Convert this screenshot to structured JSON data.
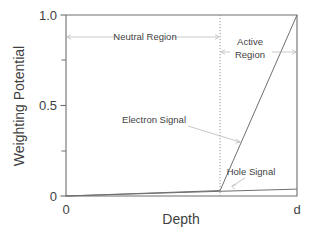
{
  "chart_data": {
    "type": "line",
    "title": "",
    "xlabel": "Depth",
    "ylabel": "Weighting Potential",
    "xlim": [
      0,
      1
    ],
    "ylim": [
      0,
      1
    ],
    "grid": false,
    "legend": "none",
    "x_tick_labels": [
      "0",
      "d"
    ],
    "x_tick_values": [
      0,
      1
    ],
    "y_tick_labels": [
      "0",
      "0.5",
      "1.0"
    ],
    "y_tick_values": [
      0,
      0.5,
      1.0
    ],
    "y_minor_ticks": [
      0.25,
      0.75
    ],
    "region_boundary_x": 0.667,
    "series": [
      {
        "name": "Electron Signal",
        "x": [
          0,
          0.667,
          1
        ],
        "values": [
          0,
          0.03,
          1.0
        ]
      },
      {
        "name": "Hole Signal",
        "x": [
          0,
          0.667,
          1
        ],
        "values": [
          0,
          0.026,
          0.038
        ]
      }
    ],
    "annotations": [
      {
        "name": "neutral-region",
        "text": "Neutral Region",
        "x": 0.31,
        "y": 0.875,
        "span": [
          0.0,
          0.667
        ]
      },
      {
        "name": "active-region",
        "text": "Active Region",
        "line1": "Active",
        "line2": "Region",
        "x": 0.79,
        "y": 0.82,
        "span": [
          0.667,
          1.0
        ]
      },
      {
        "name": "electron-signal-label",
        "text": "Electron Signal",
        "x": 0.42,
        "y": 0.4,
        "points_to": [
          0.74,
          0.3
        ]
      },
      {
        "name": "hole-signal-label",
        "text": "Hole Signal",
        "x": 0.79,
        "y": 0.145,
        "points_to": [
          0.735,
          0.052
        ]
      }
    ]
  },
  "axes": {
    "y_label": "Weighting Potential",
    "x_label": "Depth",
    "y_ticks": [
      "1.0",
      "0.5",
      "0"
    ],
    "x_ticks": [
      "0",
      "d"
    ]
  },
  "labels": {
    "neutral_region": "Neutral Region",
    "active_region_line1": "Active",
    "active_region_line2": "Region",
    "electron_signal": "Electron Signal",
    "hole_signal": "Hole Signal"
  },
  "colors": {
    "axis": "#6e6e6e",
    "series": "#6f6f6f",
    "divider": "#9a9a9a",
    "annotation": "#bdbdbd",
    "text": "#3f3f3f",
    "background": "#ffffff"
  }
}
